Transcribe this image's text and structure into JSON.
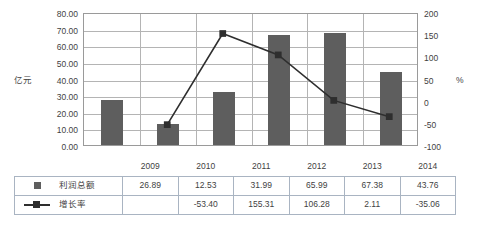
{
  "chart_data": {
    "type": "bar",
    "title": "",
    "categories": [
      "2009",
      "2010",
      "2011",
      "2012",
      "2013",
      "2014"
    ],
    "series": [
      {
        "name": "利润总额",
        "type": "bar",
        "axis": "left",
        "values": [
          26.89,
          12.53,
          31.99,
          65.99,
          67.38,
          43.76
        ],
        "labels": [
          "26.89",
          "12.53",
          "31.99",
          "65.99",
          "67.38",
          "43.76"
        ],
        "color": "#5e5e5e",
        "marker": "square"
      },
      {
        "name": "增长率",
        "type": "line",
        "axis": "right",
        "values": [
          null,
          -53.4,
          155.31,
          106.28,
          2.11,
          -35.06
        ],
        "labels": [
          "",
          "-53.40",
          "155.31",
          "106.28",
          "2.11",
          "-35.06"
        ],
        "color": "#2e2e2e",
        "marker": "square"
      }
    ],
    "xlabel": "",
    "ylabel": "亿元",
    "y2label": "%",
    "ylim": [
      0,
      80
    ],
    "y2lim": [
      -100,
      200
    ],
    "yticks": [
      "0.00",
      "10.00",
      "20.00",
      "30.00",
      "40.00",
      "50.00",
      "60.00",
      "70.00",
      "80.00"
    ],
    "ytick_values": [
      0,
      10,
      20,
      30,
      40,
      50,
      60,
      70,
      80
    ],
    "y2ticks": [
      "-100",
      "-50",
      "0",
      "50",
      "100",
      "150",
      "200"
    ],
    "y2tick_values": [
      -100,
      -50,
      0,
      50,
      100,
      150,
      200
    ],
    "grid": true,
    "legend": "table-below"
  },
  "axes": {
    "left_title": "亿元",
    "right_title": "%"
  },
  "table": {
    "header_corner": "",
    "columns": [
      "2009",
      "2010",
      "2011",
      "2012",
      "2013",
      "2014"
    ],
    "rows": [
      {
        "marker": "square-marker",
        "label": "利润总额",
        "values": [
          "26.89",
          "12.53",
          "31.99",
          "65.99",
          "67.38",
          "43.76"
        ]
      },
      {
        "marker": "line-square-marker",
        "label": "增长率",
        "values": [
          "",
          "-53.40",
          "155.31",
          "106.28",
          "2.11",
          "-35.06"
        ]
      }
    ]
  },
  "colors": {
    "bar": "#5e5e5e",
    "line": "#2e2e2e",
    "grid": "#b4b4b4",
    "plot_border": "#9a9a9a",
    "table_border": "#a9b4c2"
  }
}
